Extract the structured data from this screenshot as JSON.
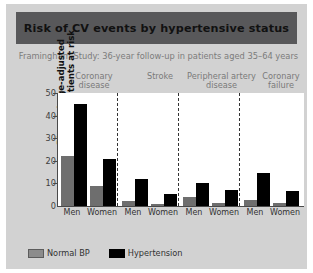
{
  "header": {
    "title": "Risk of CV events by hypertensive status",
    "subtitle": "Framingham Study: 36-year follow-up in patients aged 35–64 years"
  },
  "legend": {
    "items": [
      {
        "label": "Normal BP",
        "color": "#8c8c8c",
        "key": "normal"
      },
      {
        "label": "Hypertension",
        "color": "#000000",
        "key": "hyper"
      }
    ]
  },
  "colors": {
    "slide_background": "#d2d2d2",
    "title_band": "#58585a",
    "plot_background": "#ffffff",
    "normal_bp": "#6e6e6e",
    "hypertension": "#000000",
    "axis": "#4a4a4a",
    "group_label": "#7a7a7a"
  },
  "chart_data": {
    "type": "bar",
    "title": "Risk of CV events by hypertensive status",
    "subtitle": "Framingham Study: 36-year follow-up in patients aged 35–64 years",
    "xlabel": "",
    "ylabel": "Biennial age-adjusted rate/1000 patients at risk",
    "ylim": [
      0,
      50
    ],
    "yticks": [
      0,
      10,
      20,
      30,
      40,
      50
    ],
    "grid": false,
    "legend_position": "bottom-left",
    "groups": [
      "Coronary disease",
      "Stroke",
      "Peripheral artery disease",
      "Coronary failure"
    ],
    "categories": [
      "Coronary disease – Men",
      "Coronary disease – Women",
      "Stroke – Men",
      "Stroke – Women",
      "Peripheral artery disease – Men",
      "Peripheral artery disease – Women",
      "Coronary failure – Men",
      "Coronary failure – Women"
    ],
    "sex_labels": [
      "Men",
      "Women",
      "Men",
      "Women",
      "Men",
      "Women",
      "Men",
      "Women"
    ],
    "series": [
      {
        "name": "Normal BP",
        "values": [
          22,
          9,
          2,
          1,
          4,
          1.5,
          2.5,
          1.5
        ]
      },
      {
        "name": "Hypertension",
        "values": [
          45,
          21,
          12,
          5.5,
          10,
          7,
          14.5,
          6.5
        ]
      }
    ]
  },
  "y_axis": {
    "ticks": [
      "50",
      "40",
      "30",
      "20",
      "10",
      "0"
    ],
    "label_line1": "Biennial age-adjusted",
    "label_line2": "rate/1000 patients at risk"
  },
  "group_headers": [
    {
      "line1": "Coronary",
      "line2": "disease"
    },
    {
      "line1": "Stroke",
      "line2": ""
    },
    {
      "line1": "Peripheral artery",
      "line2": "disease"
    },
    {
      "line1": "Coronary",
      "line2": "failure"
    }
  ]
}
